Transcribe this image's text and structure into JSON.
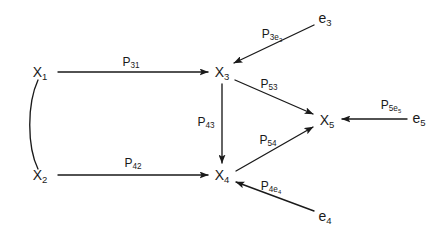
{
  "diagram": {
    "type": "path-diagram",
    "background_color": "#ffffff",
    "stroke_color": "#1a1a1a",
    "text_color": "#1a1a1a",
    "width": 446,
    "height": 239,
    "nodes": [
      {
        "id": "X1",
        "base": "X",
        "sub": "1",
        "label": "X₁",
        "x": 40,
        "y": 72,
        "kind": "latent-variable"
      },
      {
        "id": "X2",
        "base": "X",
        "sub": "2",
        "label": "X₂",
        "x": 40,
        "y": 175,
        "kind": "latent-variable"
      },
      {
        "id": "X3",
        "base": "X",
        "sub": "3",
        "label": "X₃",
        "x": 222,
        "y": 72,
        "kind": "latent-variable"
      },
      {
        "id": "X4",
        "base": "X",
        "sub": "4",
        "label": "X₄",
        "x": 222,
        "y": 175,
        "kind": "latent-variable"
      },
      {
        "id": "X5",
        "base": "X",
        "sub": "5",
        "label": "X₅",
        "x": 327,
        "y": 120,
        "kind": "latent-variable"
      },
      {
        "id": "e3",
        "base": "e",
        "sub": "3",
        "label": "e₃",
        "x": 325,
        "y": 18,
        "kind": "error-term"
      },
      {
        "id": "e4",
        "base": "e",
        "sub": "4",
        "label": "e₄",
        "x": 325,
        "y": 216,
        "kind": "error-term"
      },
      {
        "id": "e5",
        "base": "e",
        "sub": "5",
        "label": "e₅",
        "x": 419,
        "y": 118,
        "kind": "error-term"
      }
    ],
    "edges": [
      {
        "id": "P31",
        "base": "P",
        "sub": "31",
        "label": "P₃₁",
        "from": "X1",
        "to": "X3",
        "label_x": 131,
        "label_y": 62,
        "arrow": "single"
      },
      {
        "id": "P42",
        "base": "P",
        "sub": "42",
        "label": "P₄₂",
        "from": "X2",
        "to": "X4",
        "label_x": 133,
        "label_y": 163,
        "arrow": "single"
      },
      {
        "id": "P43",
        "base": "P",
        "sub": "43",
        "label": "P₄₃",
        "from": "X3",
        "to": "X4",
        "label_x": 206,
        "label_y": 122,
        "arrow": "single"
      },
      {
        "id": "P53",
        "base": "P",
        "sub": "53",
        "label": "P₅₃",
        "from": "X3",
        "to": "X5",
        "label_x": 269,
        "label_y": 84,
        "arrow": "single"
      },
      {
        "id": "P54",
        "base": "P",
        "sub": "54",
        "label": "P₅₄",
        "from": "X4",
        "to": "X5",
        "label_x": 268,
        "label_y": 140,
        "arrow": "single"
      },
      {
        "id": "P3e3",
        "base": "P",
        "sub": "3e3",
        "label": "P₃ₑ₃",
        "from": "e3",
        "to": "X3",
        "label_x": 272,
        "label_y": 34,
        "arrow": "single"
      },
      {
        "id": "P4e4",
        "base": "P",
        "sub": "4e4",
        "label": "P₄ₑ₄",
        "from": "e4",
        "to": "X4",
        "label_x": 271,
        "label_y": 186,
        "arrow": "single"
      },
      {
        "id": "P5e5",
        "base": "P",
        "sub": "5e5",
        "label": "P₅ₑ₅",
        "from": "e5",
        "to": "X5",
        "label_x": 391,
        "label_y": 105,
        "arrow": "single"
      },
      {
        "id": "corr-x1-x2",
        "base": "",
        "sub": "",
        "label": "",
        "from": "X1",
        "to": "X2",
        "label_x": 0,
        "label_y": 0,
        "arrow": "none"
      }
    ]
  }
}
